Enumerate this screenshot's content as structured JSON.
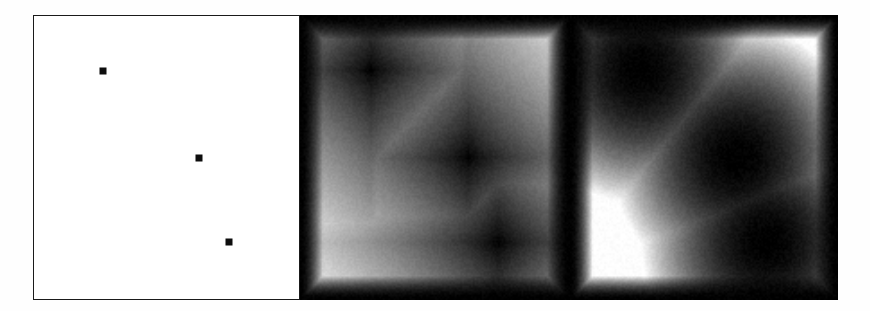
{
  "figure": {
    "title": "",
    "background_color": "#fefefe",
    "width": 870,
    "height": 311,
    "panel_count": 3
  },
  "chart_data": {
    "type": "heatmap",
    "title": "",
    "subtitle": "",
    "xlabel": "",
    "ylabel": "",
    "grid": false,
    "legend_position": "none",
    "domain": {
      "x": [
        0,
        1
      ],
      "y": [
        0,
        1
      ],
      "xlim": [
        0,
        1
      ],
      "ylim": [
        0,
        1
      ]
    },
    "seed_points": [
      {
        "id": "p1",
        "x": 0.262,
        "y": 0.193,
        "label": ""
      },
      {
        "id": "p2",
        "x": 0.622,
        "y": 0.5,
        "label": ""
      },
      {
        "id": "p3",
        "x": 0.734,
        "y": 0.797,
        "label": ""
      }
    ],
    "colormap": {
      "name": "gray",
      "low_color": "#000000",
      "high_color": "#ffffff",
      "low_meaning": "near a seed point (distance 0)",
      "high_meaning": "far from all seed points (maximum distance)"
    },
    "panels": [
      {
        "index": 0,
        "name": "point-set",
        "label": "",
        "render": "points",
        "metric": "none",
        "background_color": "#ffffff",
        "border_color": "#1a1a1a",
        "marker_color": "#0d0d0d",
        "marker_size_px": 7,
        "bbox": {
          "x": 33,
          "y": 15,
          "w": 267,
          "h": 285
        }
      },
      {
        "index": 1,
        "name": "manhattan-distance-field",
        "label": "",
        "render": "field",
        "metric": "manhattan",
        "metric_exponent": 1,
        "iso_shape": "diamond",
        "gamma": 0.85,
        "saturation": 1.0,
        "noise": 0.045,
        "bbox": {
          "x": 300,
          "y": 15,
          "w": 270,
          "h": 285
        }
      },
      {
        "index": 2,
        "name": "euclidean-distance-field",
        "label": "",
        "render": "field",
        "metric": "euclidean",
        "metric_exponent": 2,
        "iso_shape": "circle",
        "gamma": 2.0,
        "saturation": 0.62,
        "noise": 0.05,
        "bbox": {
          "x": 570,
          "y": 15,
          "w": 268,
          "h": 285
        }
      }
    ],
    "field_resolution": {
      "cols": 150,
      "rows": 158
    },
    "border_falloff": {
      "enabled": true,
      "width_fraction": 0.085,
      "note": "field panels darken toward the outer frame edge"
    }
  }
}
